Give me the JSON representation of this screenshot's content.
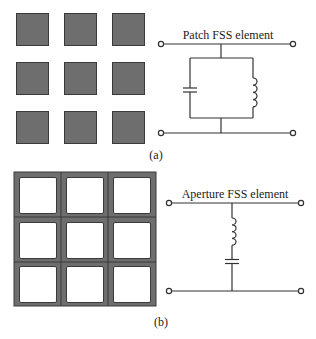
{
  "panel_a": {
    "label": "(a)",
    "title": "Patch FSS element",
    "array": {
      "rows": 3,
      "cols": 3,
      "type": "patch",
      "fill_color": "#6e6e6e",
      "edge_color": "#3a3a3a"
    },
    "circuit": {
      "topology": "parallel LC (shunt)",
      "components": [
        "capacitor",
        "inductor"
      ]
    }
  },
  "panel_b": {
    "label": "(b)",
    "title": "Aperture FSS element",
    "array": {
      "rows": 3,
      "cols": 3,
      "type": "aperture",
      "fill_color": "#6e6e6e",
      "edge_color": "#3a3a3a"
    },
    "circuit": {
      "topology": "series LC (shunt)",
      "components": [
        "inductor",
        "capacitor"
      ]
    }
  }
}
